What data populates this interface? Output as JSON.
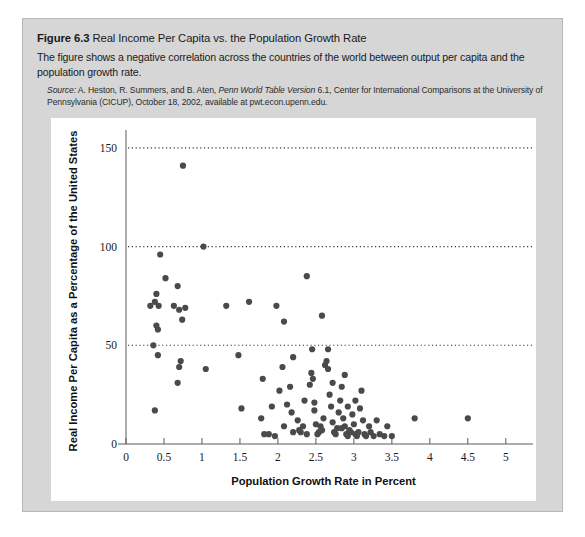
{
  "figure": {
    "number": "Figure 6.3",
    "name": "Real Income Per Capita vs. the Population Growth Rate",
    "description": "The figure shows a negative correlation across the countries of the world between output per capita and the population growth rate.",
    "source_lead": "Source:",
    "source_text_a": " A. Heston, R. Summers, and B. Aten, ",
    "source_italic": "Penn World Table Version",
    "source_text_b": " 6.1, Center for International Comparisons at the University of Pennsylvania (CICUP), October 18, 2002, available at pwt.econ.upenn.edu."
  },
  "chart_data": {
    "type": "scatter",
    "title": "Real Income Per Capita vs. the Population Growth Rate",
    "xlabel": "Population Growth Rate in Percent",
    "ylabel": "Real Income Per Capita as a Percentage of the United States",
    "xlim": [
      0,
      5.2
    ],
    "ylim": [
      0,
      155
    ],
    "xticks": [
      0,
      0.5,
      1,
      1.5,
      2,
      2.5,
      3,
      3.5,
      4,
      4.5,
      5
    ],
    "xticklabels": [
      "0",
      "0.5",
      "1",
      "1.5",
      "2",
      "2.5",
      "3",
      "3.5",
      "4",
      "4.5",
      "5"
    ],
    "yticks": [
      0,
      50,
      100,
      150
    ],
    "yticklabels": [
      "0",
      "50",
      "100",
      "150"
    ],
    "grid": "horizontal-dotted at 50, 100, 150",
    "legend": "none",
    "marker_color": "#4a4a4a",
    "points": [
      [
        0.75,
        141
      ],
      [
        0.45,
        96
      ],
      [
        1.02,
        100
      ],
      [
        0.52,
        84
      ],
      [
        0.4,
        76
      ],
      [
        0.38,
        72
      ],
      [
        0.32,
        70
      ],
      [
        0.43,
        70
      ],
      [
        0.63,
        70
      ],
      [
        0.7,
        68
      ],
      [
        0.78,
        69
      ],
      [
        0.74,
        63
      ],
      [
        0.4,
        60
      ],
      [
        0.42,
        58
      ],
      [
        1.32,
        70
      ],
      [
        1.62,
        72
      ],
      [
        1.98,
        70
      ],
      [
        2.08,
        62
      ],
      [
        0.68,
        80
      ],
      [
        2.38,
        85
      ],
      [
        2.58,
        65
      ],
      [
        0.36,
        50
      ],
      [
        0.42,
        45
      ],
      [
        0.72,
        42
      ],
      [
        0.7,
        39
      ],
      [
        0.68,
        31
      ],
      [
        0.38,
        17
      ],
      [
        1.05,
        38
      ],
      [
        1.48,
        45
      ],
      [
        1.8,
        33
      ],
      [
        1.52,
        18
      ],
      [
        1.78,
        13
      ],
      [
        1.82,
        5
      ],
      [
        1.88,
        5
      ],
      [
        1.96,
        4
      ],
      [
        2.02,
        27
      ],
      [
        2.06,
        39
      ],
      [
        2.12,
        20
      ],
      [
        2.18,
        16
      ],
      [
        2.2,
        6
      ],
      [
        2.26,
        12
      ],
      [
        2.28,
        7
      ],
      [
        2.3,
        6
      ],
      [
        2.33,
        9
      ],
      [
        2.38,
        5
      ],
      [
        2.42,
        30
      ],
      [
        2.44,
        36
      ],
      [
        2.46,
        33
      ],
      [
        2.48,
        21
      ],
      [
        2.5,
        10
      ],
      [
        2.52,
        5
      ],
      [
        2.54,
        6
      ],
      [
        2.56,
        9
      ],
      [
        2.58,
        7
      ],
      [
        2.6,
        13
      ],
      [
        2.62,
        40
      ],
      [
        2.64,
        42
      ],
      [
        2.66,
        38
      ],
      [
        2.68,
        25
      ],
      [
        2.7,
        19
      ],
      [
        2.72,
        11
      ],
      [
        2.74,
        6
      ],
      [
        2.76,
        5
      ],
      [
        2.78,
        8
      ],
      [
        2.8,
        16
      ],
      [
        2.82,
        22
      ],
      [
        2.84,
        29
      ],
      [
        2.86,
        13
      ],
      [
        2.88,
        9
      ],
      [
        2.9,
        5
      ],
      [
        2.92,
        4
      ],
      [
        2.94,
        7
      ],
      [
        2.96,
        6
      ],
      [
        2.98,
        15
      ],
      [
        3.0,
        10
      ],
      [
        3.02,
        5
      ],
      [
        3.04,
        4
      ],
      [
        3.06,
        6
      ],
      [
        3.08,
        18
      ],
      [
        3.1,
        27
      ],
      [
        3.12,
        12
      ],
      [
        3.14,
        5
      ],
      [
        3.16,
        4
      ],
      [
        3.2,
        9
      ],
      [
        3.22,
        6
      ],
      [
        3.26,
        4
      ],
      [
        3.3,
        12
      ],
      [
        3.34,
        5
      ],
      [
        3.4,
        4
      ],
      [
        3.44,
        9
      ],
      [
        3.5,
        4
      ],
      [
        3.8,
        13
      ],
      [
        4.5,
        13
      ],
      [
        2.2,
        44
      ],
      [
        2.35,
        22
      ],
      [
        2.45,
        48
      ],
      [
        2.66,
        48
      ],
      [
        2.88,
        35
      ],
      [
        2.16,
        29
      ],
      [
        1.92,
        19
      ],
      [
        2.08,
        9
      ],
      [
        2.48,
        17
      ],
      [
        2.72,
        31
      ],
      [
        3.02,
        22
      ],
      [
        2.84,
        8
      ],
      [
        2.92,
        19
      ]
    ]
  }
}
